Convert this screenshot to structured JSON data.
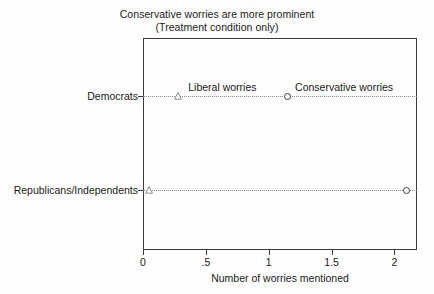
{
  "chart_data": {
    "type": "scatter",
    "title": "Conservative worries are more prominent",
    "subtitle": "(Treatment condition only)",
    "xlabel": "Number of worries mentioned",
    "ylabel": "",
    "xlim": [
      0,
      2.18
    ],
    "xticks": [
      0,
      0.5,
      1,
      1.5,
      2
    ],
    "xticklabels": [
      "0",
      ".5",
      "1",
      "1.5",
      "2"
    ],
    "categories": [
      "Democrats",
      "Republicans/Independents"
    ],
    "grid": false,
    "legend_position": "inline-annotation",
    "series": [
      {
        "name": "Liberal worries",
        "marker": "triangle-open",
        "values": [
          0.28,
          0.05
        ]
      },
      {
        "name": "Conservative worries",
        "marker": "circle-open",
        "values": [
          1.15,
          2.1
        ]
      }
    ],
    "annotations": [
      {
        "text": "Liberal worries",
        "x": 0.36,
        "category": "Democrats"
      },
      {
        "text": "Conservative worries",
        "x": 1.21,
        "category": "Democrats"
      }
    ],
    "colors": {
      "axis": "#3a3a3a",
      "marker": "#3c3c3c",
      "connector": "#8d8d8d",
      "text": "#1a1a1a",
      "background": "#fefefe"
    }
  }
}
